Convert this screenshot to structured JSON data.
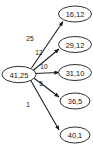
{
  "diagram": {
    "type": "directed-graph",
    "title": "",
    "background_color": "#ffffff",
    "node_stroke_color": "#1a1a1a",
    "edge_color": "#1a1a1a",
    "text_color": "#111111",
    "source_node": {
      "id": "source",
      "label": "41,25"
    },
    "target_nodes": [
      {
        "id": "t1",
        "label": "16,12"
      },
      {
        "id": "t2",
        "label": "29,12"
      },
      {
        "id": "t3",
        "label": "31,10"
      },
      {
        "id": "t4",
        "label": "36,5"
      },
      {
        "id": "t5",
        "label": "40,1"
      }
    ],
    "edges": [
      {
        "from": "41,25",
        "to": "16,12",
        "label": "25"
      },
      {
        "from": "41,25",
        "to": "29,12",
        "label": "12"
      },
      {
        "from": "41,25",
        "to": "31,10",
        "label": "10"
      },
      {
        "from": "41,25",
        "to": "36,5",
        "label": "5"
      },
      {
        "from": "41,25",
        "to": "40,1",
        "label": "1"
      }
    ]
  }
}
